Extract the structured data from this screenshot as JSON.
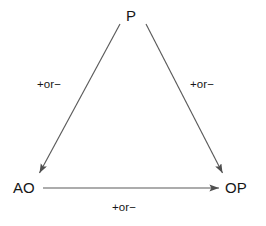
{
  "diagram": {
    "shape": "triangle",
    "background_color": "#ffffff",
    "line_color": "#5a5a5a",
    "text_color": "#161616",
    "nodes": [
      {
        "id": "P",
        "label": "P",
        "x": 133,
        "y": 16,
        "role": "apex"
      },
      {
        "id": "AO",
        "label": "AO",
        "x": 27,
        "y": 188,
        "role": "bottom-left"
      },
      {
        "id": "OP",
        "label": "OP",
        "x": 239,
        "y": 188,
        "role": "bottom-right"
      }
    ],
    "edges": [
      {
        "id": "p-to-ao",
        "from": "P",
        "to": "AO",
        "label": "+or−",
        "arrowhead": "to",
        "x1": 120,
        "y1": 24,
        "x2": 38,
        "y2": 176
      },
      {
        "id": "p-to-op",
        "from": "P",
        "to": "OP",
        "label": "+or−",
        "arrowhead": "to",
        "x1": 146,
        "y1": 24,
        "x2": 224,
        "y2": 176
      },
      {
        "id": "ao-to-op",
        "from": "AO",
        "to": "OP",
        "label": "+or−",
        "arrowhead": "to",
        "x1": 43,
        "y1": 188,
        "x2": 222,
        "y2": 188
      }
    ]
  }
}
